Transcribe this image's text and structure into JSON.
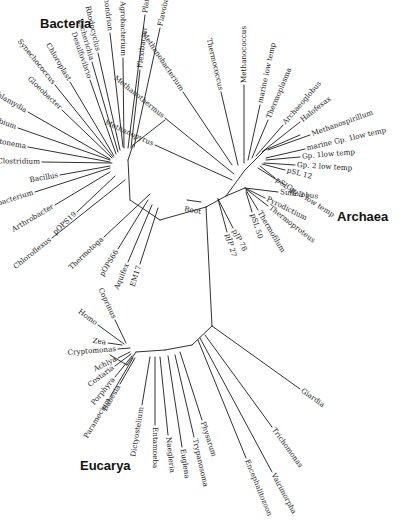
{
  "diagram": {
    "type": "unrooted phylogenetic tree (universal tree of life)",
    "domains": [
      {
        "name": "Bacteria",
        "x": 40,
        "y": 28
      },
      {
        "name": "Archaea",
        "x": 337,
        "y": 221
      },
      {
        "name": "Eucarya",
        "x": 80,
        "y": 470
      }
    ],
    "root_label": {
      "text": "Root",
      "x": 184,
      "y": 211,
      "angle": 10
    },
    "root_bar": {
      "x1": 187,
      "y1": 200,
      "x2": 201,
      "y2": 202
    },
    "nodes": {
      "bacteria_hub": [
        128,
        160
      ],
      "bacteria_arc_mid": [
        132,
        195
      ],
      "bacteria_base": [
        160,
        220
      ],
      "center": [
        206,
        207
      ],
      "archaea_base": [
        226,
        196
      ],
      "archaea_hub": [
        245,
        170
      ],
      "archaea_cren": [
        245,
        188
      ],
      "euk_top": [
        212,
        326
      ],
      "euk_arc": [
        192,
        345
      ],
      "euk_hub": [
        136,
        352
      ]
    },
    "internal_edges": [
      [
        [
          128,
          160
        ],
        [
          133,
          145
        ]
      ],
      [
        [
          133,
          145
        ],
        [
          165,
          120
        ]
      ],
      [
        [
          128,
          160
        ],
        [
          130,
          200
        ]
      ],
      [
        [
          130,
          200
        ],
        [
          160,
          220
        ]
      ],
      [
        [
          160,
          220
        ],
        [
          206,
          207
        ]
      ],
      [
        [
          206,
          207
        ],
        [
          212,
          326
        ]
      ],
      [
        [
          206,
          207
        ],
        [
          226,
          196
        ]
      ],
      [
        [
          226,
          196
        ],
        [
          245,
          170
        ]
      ],
      [
        [
          245,
          170
        ],
        [
          265,
          150
        ]
      ],
      [
        [
          265,
          150
        ],
        [
          300,
          135
        ]
      ],
      [
        [
          226,
          196
        ],
        [
          245,
          188
        ]
      ],
      [
        [
          212,
          326
        ],
        [
          192,
          345
        ]
      ],
      [
        [
          192,
          345
        ],
        [
          165,
          350
        ]
      ],
      [
        [
          165,
          350
        ],
        [
          136,
          352
        ]
      ],
      [
        [
          136,
          352
        ],
        [
          127,
          365
        ]
      ],
      [
        [
          127,
          365
        ],
        [
          110,
          355
        ]
      ]
    ],
    "tips": {
      "bacteria": [
        {
          "name": "mitochondrion",
          "x1": 123,
          "y1": 147,
          "x2": 110,
          "y2": 33,
          "angle": 84
        },
        {
          "name": "Rhodocyclus",
          "x1": 120,
          "y1": 150,
          "x2": 98,
          "y2": 53,
          "angle": 76
        },
        {
          "name": "Escherichia",
          "x1": 118,
          "y1": 152,
          "x2": 92,
          "y2": 62,
          "angle": 72
        },
        {
          "name": "Desulfovibrio",
          "x1": 116,
          "y1": 154,
          "x2": 90,
          "y2": 80,
          "angle": 68
        },
        {
          "name": "Agrobacterium",
          "x1": 124,
          "y1": 148,
          "x2": 123,
          "y2": 58,
          "angle": -90
        },
        {
          "name": "Planctomyces",
          "x1": 128,
          "y1": 148,
          "x2": 145,
          "y2": 15,
          "angle": -82
        },
        {
          "name": "Flexibacter",
          "x1": 131,
          "y1": 148,
          "x2": 140,
          "y2": 70,
          "angle": -76
        },
        {
          "name": "Flavobacterium",
          "x1": 134,
          "y1": 147,
          "x2": 160,
          "y2": 28,
          "angle": -70
        },
        {
          "name": "Chloroplast",
          "x1": 114,
          "y1": 156,
          "x2": 70,
          "y2": 82,
          "angle": 58
        },
        {
          "name": "Synechococcus",
          "x1": 113,
          "y1": 157,
          "x2": 55,
          "y2": 85,
          "angle": 50
        },
        {
          "name": "Gloeobacter",
          "x1": 112,
          "y1": 158,
          "x2": 62,
          "y2": 110,
          "angle": 38
        },
        {
          "name": "Chlamydia",
          "x1": 110,
          "y1": 159,
          "x2": 28,
          "y2": 112,
          "angle": 20
        },
        {
          "name": "Chlorobium",
          "x1": 110,
          "y1": 160,
          "x2": 18,
          "y2": 128,
          "angle": 14
        },
        {
          "name": "Leptonema",
          "x1": 110,
          "y1": 162,
          "x2": 28,
          "y2": 147,
          "angle": 6
        },
        {
          "name": "Clostridium",
          "x1": 112,
          "y1": 163,
          "x2": 42,
          "y2": 162,
          "angle": 1
        },
        {
          "name": "Bacillus",
          "x1": 110,
          "y1": 166,
          "x2": 60,
          "y2": 175,
          "angle": -10
        },
        {
          "name": "Heliobacterium",
          "x1": 110,
          "y1": 168,
          "x2": 35,
          "y2": 192,
          "angle": -16
        },
        {
          "name": "Arthrobacter",
          "x1": 110,
          "y1": 172,
          "x2": 55,
          "y2": 205,
          "angle": -26
        },
        {
          "name": "pOPS19",
          "x1": 115,
          "y1": 176,
          "x2": 77,
          "y2": 212,
          "angle": -34
        },
        {
          "name": "Chloroflexus",
          "x1": 125,
          "y1": 180,
          "x2": 52,
          "y2": 238,
          "angle": -40
        },
        {
          "name": "Thermotoga",
          "x1": 150,
          "y1": 194,
          "x2": 104,
          "y2": 237,
          "angle": -46
        },
        {
          "name": "pOPS66",
          "x1": 148,
          "y1": 200,
          "x2": 118,
          "y2": 249,
          "angle": -58
        },
        {
          "name": "Aquifex",
          "x1": 152,
          "y1": 205,
          "x2": 128,
          "y2": 262,
          "angle": -64
        },
        {
          "name": "EM17",
          "x1": 158,
          "y1": 208,
          "x2": 140,
          "y2": 264,
          "angle": -70
        }
      ],
      "archaea": [
        {
          "name": "Methanothermus",
          "x1": 234,
          "y1": 174,
          "x2": 165,
          "y2": 118,
          "angle": 36
        },
        {
          "name": "Methanopyrus",
          "x1": 232,
          "y1": 180,
          "x2": 155,
          "y2": 145,
          "angle": 24
        },
        {
          "name": "Methanobacterium",
          "x1": 232,
          "y1": 165,
          "x2": 183,
          "y2": 92,
          "angle": 60
        },
        {
          "name": "Thermococcus",
          "x1": 238,
          "y1": 165,
          "x2": 221,
          "y2": 92,
          "angle": 76
        },
        {
          "name": "Methanococcus",
          "x1": 244,
          "y1": 163,
          "x2": 244,
          "y2": 85,
          "angle": -90
        },
        {
          "name": "marine low temp",
          "x1": 248,
          "y1": 160,
          "x2": 260,
          "y2": 105,
          "angle": -78
        },
        {
          "name": "Thermoplasma",
          "x1": 252,
          "y1": 158,
          "x2": 268,
          "y2": 120,
          "angle": -68
        },
        {
          "name": "Archaeoglobus",
          "x1": 256,
          "y1": 156,
          "x2": 283,
          "y2": 125,
          "angle": -50
        },
        {
          "name": "Halofexax",
          "x1": 262,
          "y1": 152,
          "x2": 300,
          "y2": 122,
          "angle": -38
        },
        {
          "name": "Methanospirillum",
          "x1": 268,
          "y1": 150,
          "x2": 310,
          "y2": 135,
          "angle": -18
        },
        {
          "name": "marine Gp. 1low temp",
          "x1": 266,
          "y1": 158,
          "x2": 305,
          "y2": 149,
          "angle": -4
        },
        {
          "name": "Gp. 1low temp",
          "x1": 266,
          "y1": 160,
          "x2": 300,
          "y2": 157,
          "angle": 4
        },
        {
          "name": "Gp. 2 low temp",
          "x1": 264,
          "y1": 163,
          "x2": 295,
          "y2": 165,
          "angle": 12
        },
        {
          "name": "pSL 12",
          "x1": 262,
          "y1": 164,
          "x2": 285,
          "y2": 170,
          "angle": 16
        },
        {
          "name": "pSL 22",
          "x1": 260,
          "y1": 166,
          "x2": 275,
          "y2": 178,
          "angle": 20
        },
        {
          "name": "Gp. 3 low temp",
          "x1": 258,
          "y1": 168,
          "x2": 285,
          "y2": 185,
          "angle": 22
        },
        {
          "name": "Sulfolobus",
          "x1": 245,
          "y1": 188,
          "x2": 278,
          "y2": 192,
          "angle": 26
        },
        {
          "name": "Pyrodictium",
          "x1": 245,
          "y1": 188,
          "x2": 265,
          "y2": 198,
          "angle": 30
        },
        {
          "name": "Thermoproteus",
          "x1": 246,
          "y1": 189,
          "x2": 268,
          "y2": 206,
          "angle": 40
        },
        {
          "name": "Thermofilum",
          "x1": 246,
          "y1": 190,
          "x2": 258,
          "y2": 210,
          "angle": 48
        },
        {
          "name": "pSL 50",
          "x1": 246,
          "y1": 192,
          "x2": 252,
          "y2": 212,
          "angle": 58
        },
        {
          "name": "pJP 78",
          "x1": 218,
          "y1": 199,
          "x2": 233,
          "y2": 228,
          "angle": 58
        },
        {
          "name": "pJP 27",
          "x1": 218,
          "y1": 199,
          "x2": 227,
          "y2": 232,
          "angle": 64
        }
      ],
      "eucarya": [
        {
          "name": "Coprinus",
          "x1": 126,
          "y1": 343,
          "x2": 115,
          "y2": 320,
          "angle": 64
        },
        {
          "name": "Homo",
          "x1": 124,
          "y1": 344,
          "x2": 98,
          "y2": 325,
          "angle": 40
        },
        {
          "name": "Zea",
          "x1": 122,
          "y1": 345,
          "x2": 108,
          "y2": 343,
          "angle": 0
        },
        {
          "name": "Cryptomonas",
          "x1": 130,
          "y1": 348,
          "x2": 118,
          "y2": 349,
          "angle": 0
        },
        {
          "name": "Achlya",
          "x1": 130,
          "y1": 352,
          "x2": 118,
          "y2": 358,
          "angle": -20
        },
        {
          "name": "Costaria",
          "x1": 131,
          "y1": 354,
          "x2": 115,
          "y2": 366,
          "angle": -38
        },
        {
          "name": "Porphyra",
          "x1": 132,
          "y1": 356,
          "x2": 115,
          "y2": 377,
          "angle": -52
        },
        {
          "name": "Paramecium",
          "x1": 133,
          "y1": 358,
          "x2": 110,
          "y2": 397,
          "angle": -60
        },
        {
          "name": "Babesia",
          "x1": 135,
          "y1": 358,
          "x2": 120,
          "y2": 384,
          "angle": -66
        },
        {
          "name": "Dictyostelium",
          "x1": 150,
          "y1": 357,
          "x2": 142,
          "y2": 405,
          "angle": -82
        },
        {
          "name": "Entamoeba",
          "x1": 155,
          "y1": 357,
          "x2": 155,
          "y2": 425,
          "angle": -90
        },
        {
          "name": "Naegleria",
          "x1": 160,
          "y1": 357,
          "x2": 168,
          "y2": 435,
          "angle": 84
        },
        {
          "name": "Euglena",
          "x1": 168,
          "y1": 356,
          "x2": 182,
          "y2": 447,
          "angle": 82
        },
        {
          "name": "Trypanosoma",
          "x1": 175,
          "y1": 355,
          "x2": 194,
          "y2": 437,
          "angle": 78
        },
        {
          "name": "Physarum",
          "x1": 180,
          "y1": 352,
          "x2": 202,
          "y2": 420,
          "angle": 72
        },
        {
          "name": "Encephalitozoon",
          "x1": 198,
          "y1": 340,
          "x2": 246,
          "y2": 458,
          "angle": 68
        },
        {
          "name": "Vairimorpha",
          "x1": 200,
          "y1": 338,
          "x2": 272,
          "y2": 472,
          "angle": 62
        },
        {
          "name": "Trichomonas",
          "x1": 205,
          "y1": 335,
          "x2": 272,
          "y2": 427,
          "angle": 54
        },
        {
          "name": "Giardia",
          "x1": 212,
          "y1": 326,
          "x2": 300,
          "y2": 389,
          "angle": 36
        }
      ]
    }
  }
}
